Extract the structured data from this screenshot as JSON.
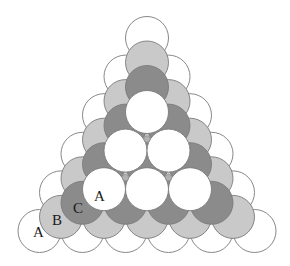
{
  "diagram": {
    "title": "",
    "lattice": {
      "spacing": 43,
      "row_height": 38.6,
      "radius": 21.5,
      "stroke": "#7a7a7a"
    },
    "layers": [
      {
        "name": "A",
        "apex": [
          147,
          38
        ],
        "rows": 6,
        "fill": "#ffffff",
        "radius": 21.5
      },
      {
        "name": "B",
        "apex": [
          147,
          62.5
        ],
        "rows": 5,
        "fill": "#c9c9c9",
        "radius": 21.5
      },
      {
        "name": "C",
        "apex": [
          147,
          87
        ],
        "rows": 4,
        "fill": "#8b8b8b",
        "radius": 21.5
      },
      {
        "name": "A",
        "apex": [
          147,
          112
        ],
        "rows": 3,
        "fill": "#ffffff",
        "radius": 21.5
      },
      {
        "name": "B-interstitial",
        "apex": [
          147,
          139
        ],
        "rows": 2,
        "fill": "#b3b3b3",
        "radius": 3.2
      }
    ],
    "labels": [
      {
        "text": "A",
        "x": 33,
        "y": 237
      },
      {
        "text": "B",
        "x": 52,
        "y": 225
      },
      {
        "text": "C",
        "x": 73,
        "y": 213
      },
      {
        "text": "A",
        "x": 94,
        "y": 201
      }
    ]
  }
}
